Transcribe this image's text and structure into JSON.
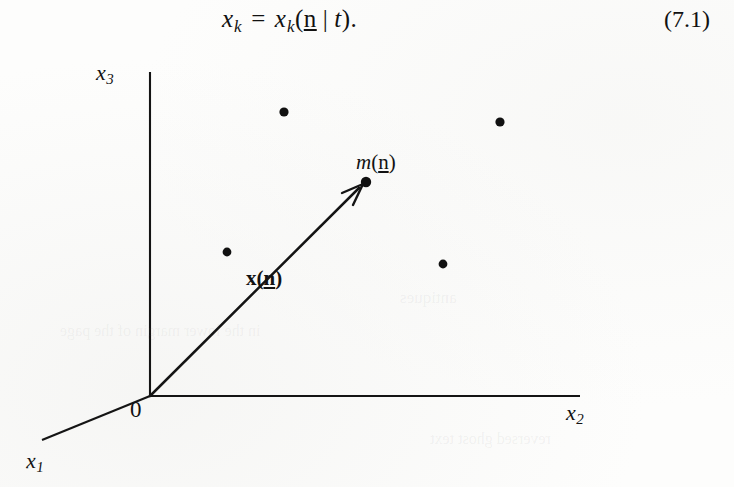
{
  "equation": {
    "variable": "x",
    "subscript": "k",
    "equals": "=",
    "function_name": "x",
    "function_subscript": "k",
    "open_paren": "(",
    "argument": "n",
    "separator": "|",
    "condition": "t",
    "close_paren": ")",
    "period": ".",
    "full_text": "x_k = x_k(n | t).",
    "number": "(7.1)"
  },
  "figure": {
    "axes": [
      {
        "name": "x3-axis",
        "label_var": "x",
        "label_sub": "3",
        "kind": "vertical"
      },
      {
        "name": "x2-axis",
        "label_var": "x",
        "label_sub": "2",
        "kind": "horizontal"
      },
      {
        "name": "x1-axis",
        "label_var": "x",
        "label_sub": "1",
        "kind": "oblique"
      }
    ],
    "origin_label": "0",
    "vector_label": {
      "symbol": "x",
      "open_paren": "(",
      "argument": "n",
      "close_paren": ")",
      "full_text": "x(n)"
    },
    "point_label": {
      "symbol": "m",
      "open_paren": "(",
      "argument": "n",
      "close_paren": ")",
      "full_text": "m(n)"
    },
    "points": [
      {
        "name": "particle-dot-1",
        "x": 284,
        "y": 66,
        "r": 4.6
      },
      {
        "name": "particle-dot-2",
        "x": 500,
        "y": 76,
        "r": 4.6
      },
      {
        "name": "particle-dot-3",
        "x": 227,
        "y": 206,
        "r": 4.4
      },
      {
        "name": "particle-dot-4",
        "x": 443,
        "y": 218,
        "r": 4.4
      },
      {
        "name": "vector-head-dot",
        "x": 366,
        "y": 136,
        "r": 5.2
      }
    ],
    "geometry": {
      "origin": {
        "x": 150,
        "y": 350
      },
      "x3_axis_top": {
        "x": 150,
        "y": 26
      },
      "x2_axis_right": {
        "x": 580,
        "y": 350
      },
      "x1_axis_end": {
        "x": 42,
        "y": 394
      },
      "vector_tip": {
        "x": 364,
        "y": 138
      }
    },
    "colors": {
      "ink": "#121212",
      "paper": "#fdfdfc",
      "bleed_through": "#78787815"
    }
  },
  "bleed_through": {
    "line_1": "antiques",
    "line_2": "in the lower margin of the page",
    "line_3": "reversed ghost text"
  }
}
